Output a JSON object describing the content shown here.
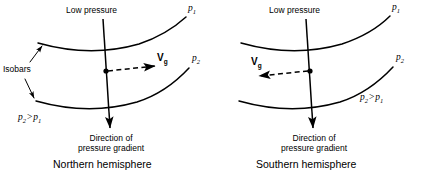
{
  "figure": {
    "background_color": "#ffffff",
    "ink_color": "#000000",
    "width": 427,
    "height": 174
  },
  "panels": [
    {
      "id": "northern",
      "caption": "Northern hemisphere",
      "low_pressure_label": "Low pressure",
      "isobar_upper_label": "p",
      "isobar_upper_sub": "1",
      "isobar_lower_label": "p",
      "isobar_lower_sub": "2",
      "inequality_left": "p",
      "inequality_left_sub": "2",
      "inequality_operator": ">",
      "inequality_right": "p",
      "inequality_right_sub": "1",
      "isobars_label": "Isobars",
      "wind_vector_label": "V",
      "wind_vector_sub": "g",
      "wind_vector_direction": "right",
      "gradient_label_line1": "Direction of",
      "gradient_label_line2": "pressure gradient"
    },
    {
      "id": "southern",
      "caption": "Southern hemisphere",
      "low_pressure_label": "Low pressure",
      "isobar_upper_label": "p",
      "isobar_upper_sub": "1",
      "isobar_lower_label": "p",
      "isobar_lower_sub": "2",
      "inequality_left": "p",
      "inequality_left_sub": "2",
      "inequality_operator": ">",
      "inequality_right": "p",
      "inequality_right_sub": "1",
      "wind_vector_label": "V",
      "wind_vector_sub": "g",
      "wind_vector_direction": "left",
      "gradient_label_line1": "Direction of",
      "gradient_label_line2": "pressure gradient"
    }
  ]
}
